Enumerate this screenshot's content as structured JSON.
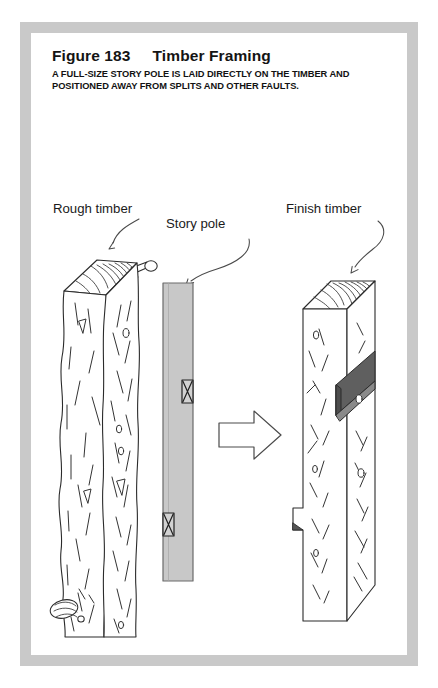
{
  "figure": {
    "title": "Figure 183     Timber Framing",
    "caption": "A FULL-SIZE STORY POLE IS LAID DIRECTLY ON THE TIMBER AND POSITIONED AWAY FROM SPLITS AND OTHER FAULTS.",
    "number": "183",
    "name": "Timber Framing"
  },
  "labels": {
    "rough_timber": "Rough timber",
    "story_pole": "Story pole",
    "finish_timber": "Finish timber"
  },
  "icons": {
    "pointer_rough": "curved-arrow-icon",
    "pointer_pole": "curved-arrow-icon",
    "pointer_finish": "curved-arrow-icon",
    "process": "block-arrow-right-icon"
  },
  "colors": {
    "frame": "#c9c9c9",
    "plate": "#ffffff",
    "ink": "#2b2b2b",
    "story_pole_fill": "#c8c8c8",
    "mortise_fill": "#5f5f5f",
    "mortise_fill_light": "#8a8a8a",
    "text": "#141414"
  },
  "diagram": {
    "panels": [
      {
        "id": "rough-timber",
        "label": "Rough timber",
        "features": [
          "end-grain-top",
          "branch-stub-knot-top",
          "knot-burl-bottom",
          "wavy-split-grain"
        ]
      },
      {
        "id": "story-pole",
        "label": "Story pole",
        "marks": 2,
        "mark_style": "bowtie-x"
      },
      {
        "id": "finish-timber",
        "label": "Finish timber",
        "features": [
          "end-grain-top",
          "dark-mortise-notch",
          "edge-notch-lower",
          "angled-bottom"
        ]
      }
    ],
    "flow_arrow": "right"
  }
}
